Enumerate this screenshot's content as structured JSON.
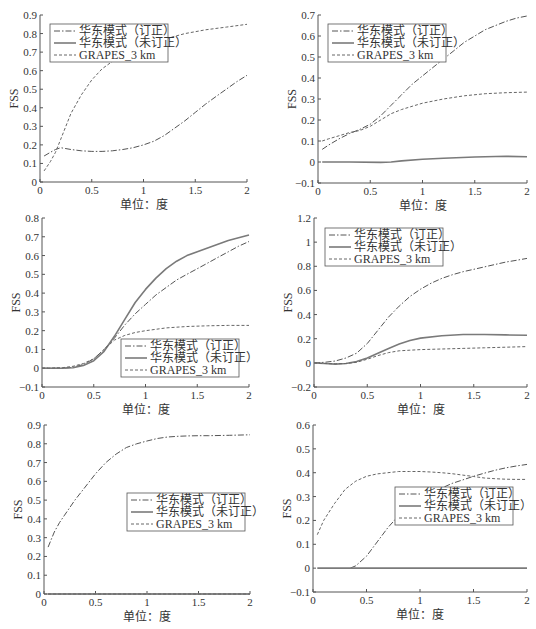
{
  "figure": {
    "width": 536,
    "height": 629,
    "colors": {
      "axis": "#555555",
      "corrected": "#555555",
      "uncorrected": "#7a7a7a",
      "grapes": "#666666",
      "text": "#333333"
    }
  },
  "legend_labels": {
    "corrected": "华东模式（订正）",
    "uncorrected": "华东模式（未订正）",
    "grapes": "GRAPES_3 km"
  },
  "chart_data": [
    {
      "id": "panel-1",
      "type": "line",
      "title": "",
      "xlabel": "单位：度",
      "ylabel": "FSS",
      "xlim": [
        0,
        2
      ],
      "ylim": [
        0,
        0.9
      ],
      "xticks": [
        0,
        0.5,
        1,
        1.5,
        2
      ],
      "xtick_labels": [
        "0",
        "0.5",
        "1",
        "1.5",
        "2"
      ],
      "yticks": [
        0,
        0.1,
        0.2,
        0.3,
        0.4,
        0.5,
        0.6,
        0.7,
        0.8,
        0.9
      ],
      "ytick_labels": [
        "0",
        "0.1",
        "0.2",
        "0.3",
        "0.4",
        "0.5",
        "0.6",
        "0.7",
        "0.8",
        "0.9"
      ],
      "grid": false,
      "legend_position": "upper left",
      "box": {
        "left": 40,
        "top": 15,
        "right": 247,
        "bottom": 182
      },
      "legend_box": {
        "x": 50,
        "y": 24,
        "w": 118,
        "h": 38
      },
      "series": [
        {
          "name": "华东模式（订正）",
          "style": "dashdot",
          "x": [
            0.04,
            0.1,
            0.15,
            0.2,
            0.25,
            0.3,
            0.4,
            0.5,
            0.6,
            0.7,
            0.8,
            0.9,
            1.0,
            1.1,
            1.2,
            1.3,
            1.4,
            1.5,
            1.6,
            1.7,
            1.8,
            1.9,
            2.0
          ],
          "values": [
            0.14,
            0.16,
            0.175,
            0.185,
            0.18,
            0.175,
            0.168,
            0.165,
            0.165,
            0.168,
            0.175,
            0.185,
            0.2,
            0.22,
            0.25,
            0.29,
            0.33,
            0.375,
            0.42,
            0.46,
            0.5,
            0.54,
            0.575
          ]
        },
        {
          "name": "华东模式（未订正）",
          "style": "solid",
          "x": [],
          "values": []
        },
        {
          "name": "GRAPES_3 km",
          "style": "dashed",
          "x": [
            0.04,
            0.1,
            0.15,
            0.2,
            0.3,
            0.4,
            0.5,
            0.6,
            0.7,
            0.8,
            0.9,
            1.0,
            1.2,
            1.4,
            1.6,
            1.8,
            2.0
          ],
          "values": [
            0.06,
            0.11,
            0.16,
            0.23,
            0.37,
            0.47,
            0.55,
            0.61,
            0.65,
            0.68,
            0.71,
            0.73,
            0.77,
            0.8,
            0.82,
            0.835,
            0.85
          ]
        }
      ]
    },
    {
      "id": "panel-2",
      "type": "line",
      "title": "",
      "xlabel": "单位：度",
      "ylabel": "FSS",
      "xlim": [
        0,
        2
      ],
      "ylim": [
        -0.1,
        0.7
      ],
      "xticks": [
        0,
        0.5,
        1,
        1.5,
        2
      ],
      "xtick_labels": [
        "0",
        "0.5",
        "1",
        "1.5",
        "2"
      ],
      "yticks": [
        -0.1,
        0,
        0.1,
        0.2,
        0.3,
        0.4,
        0.5,
        0.6,
        0.7
      ],
      "ytick_labels": [
        "−0.1",
        "0",
        "0.1",
        "0.2",
        "0.3",
        "0.4",
        "0.5",
        "0.6",
        "0.7"
      ],
      "grid": false,
      "legend_position": "upper left",
      "box": {
        "left": 318,
        "top": 15,
        "right": 527,
        "bottom": 183
      },
      "legend_box": {
        "x": 328,
        "y": 24,
        "w": 118,
        "h": 38
      },
      "series": [
        {
          "name": "华东模式（订正）",
          "style": "dashdot",
          "x": [
            0.04,
            0.1,
            0.2,
            0.3,
            0.4,
            0.5,
            0.6,
            0.7,
            0.8,
            0.9,
            1.0,
            1.1,
            1.2,
            1.3,
            1.4,
            1.5,
            1.6,
            1.7,
            1.8,
            1.9,
            2.0
          ],
          "values": [
            0.06,
            0.08,
            0.11,
            0.135,
            0.155,
            0.18,
            0.22,
            0.27,
            0.32,
            0.37,
            0.41,
            0.45,
            0.49,
            0.53,
            0.57,
            0.6,
            0.63,
            0.65,
            0.67,
            0.685,
            0.695
          ]
        },
        {
          "name": "华东模式（未订正）",
          "style": "solid",
          "x": [
            0.04,
            0.3,
            0.6,
            0.7,
            0.8,
            1.0,
            1.2,
            1.5,
            1.8,
            2.0
          ],
          "values": [
            0.0,
            0.0,
            -0.002,
            0.0,
            0.005,
            0.013,
            0.018,
            0.024,
            0.027,
            0.025
          ]
        },
        {
          "name": "GRAPES_3 km",
          "style": "dashed",
          "x": [
            0.04,
            0.1,
            0.2,
            0.3,
            0.4,
            0.5,
            0.6,
            0.7,
            0.8,
            0.9,
            1.0,
            1.2,
            1.4,
            1.6,
            1.8,
            2.0
          ],
          "values": [
            0.1,
            0.11,
            0.125,
            0.14,
            0.15,
            0.17,
            0.2,
            0.23,
            0.25,
            0.265,
            0.28,
            0.3,
            0.315,
            0.325,
            0.33,
            0.333
          ]
        }
      ]
    },
    {
      "id": "panel-3",
      "type": "line",
      "title": "",
      "xlabel": "单位：度",
      "ylabel": "FSS",
      "xlim": [
        0,
        2
      ],
      "ylim": [
        -0.1,
        0.8
      ],
      "xticks": [
        0,
        0.5,
        1,
        1.5,
        2
      ],
      "xtick_labels": [
        "0",
        "0.5",
        "1",
        "1.5",
        "2"
      ],
      "yticks": [
        -0.1,
        0,
        0.1,
        0.2,
        0.3,
        0.4,
        0.5,
        0.6,
        0.7,
        0.8
      ],
      "ytick_labels": [
        "−0.1",
        "0",
        "0.1",
        "0.2",
        "0.3",
        "0.4",
        "0.5",
        "0.6",
        "0.7",
        "0.8"
      ],
      "grid": false,
      "legend_position": "lower right",
      "box": {
        "left": 42,
        "top": 218,
        "right": 249,
        "bottom": 387
      },
      "legend_box": {
        "x": 121,
        "y": 339,
        "w": 118,
        "h": 38
      },
      "series": [
        {
          "name": "华东模式（订正）",
          "style": "dashdot",
          "x": [
            0,
            0.2,
            0.3,
            0.4,
            0.5,
            0.6,
            0.7,
            0.8,
            0.9,
            1.0,
            1.1,
            1.2,
            1.3,
            1.4,
            1.5,
            1.6,
            1.7,
            1.8,
            1.9,
            2.0
          ],
          "values": [
            0,
            0,
            0.005,
            0.02,
            0.05,
            0.1,
            0.16,
            0.23,
            0.29,
            0.34,
            0.39,
            0.43,
            0.47,
            0.5,
            0.53,
            0.56,
            0.59,
            0.62,
            0.65,
            0.675
          ]
        },
        {
          "name": "华东模式（未订正）",
          "style": "solid",
          "x": [
            0,
            0.2,
            0.3,
            0.4,
            0.5,
            0.6,
            0.7,
            0.8,
            0.9,
            1.0,
            1.1,
            1.2,
            1.3,
            1.4,
            1.5,
            1.6,
            1.7,
            1.8,
            1.9,
            2.0
          ],
          "values": [
            0,
            0,
            0.003,
            0.015,
            0.04,
            0.09,
            0.17,
            0.26,
            0.35,
            0.42,
            0.48,
            0.53,
            0.57,
            0.6,
            0.62,
            0.64,
            0.66,
            0.68,
            0.695,
            0.71
          ]
        },
        {
          "name": "GRAPES_3 km",
          "style": "dashed",
          "x": [
            0,
            0.2,
            0.3,
            0.4,
            0.5,
            0.6,
            0.7,
            0.8,
            0.9,
            1.0,
            1.2,
            1.4,
            1.6,
            1.8,
            2.0
          ],
          "values": [
            0,
            0.003,
            0.01,
            0.025,
            0.05,
            0.1,
            0.15,
            0.175,
            0.19,
            0.2,
            0.215,
            0.222,
            0.226,
            0.228,
            0.228
          ]
        }
      ]
    },
    {
      "id": "panel-4",
      "type": "line",
      "title": "",
      "xlabel": "单位：度",
      "ylabel": "FSS",
      "xlim": [
        0,
        2
      ],
      "ylim": [
        -0.2,
        1.2
      ],
      "xticks": [
        0,
        0.5,
        1,
        1.5,
        2
      ],
      "xtick_labels": [
        "0",
        "0.5",
        "1",
        "1.5",
        "2"
      ],
      "yticks": [
        -0.2,
        0,
        0.2,
        0.4,
        0.6,
        0.8,
        1.0,
        1.2
      ],
      "ytick_labels": [
        "−0.2",
        "0",
        "0.2",
        "0.4",
        "0.6",
        "0.8",
        "1",
        "1.2"
      ],
      "grid": false,
      "legend_position": "upper left",
      "box": {
        "left": 314,
        "top": 218,
        "right": 527,
        "bottom": 387
      },
      "legend_box": {
        "x": 325,
        "y": 228,
        "w": 118,
        "h": 38
      },
      "series": [
        {
          "name": "华东模式（订正）",
          "style": "dashdot",
          "x": [
            0,
            0.1,
            0.2,
            0.3,
            0.4,
            0.5,
            0.6,
            0.7,
            0.8,
            0.9,
            1.0,
            1.1,
            1.2,
            1.3,
            1.4,
            1.5,
            1.6,
            1.7,
            1.8,
            1.9,
            2.0
          ],
          "values": [
            0,
            0.005,
            0.015,
            0.04,
            0.08,
            0.16,
            0.27,
            0.38,
            0.47,
            0.55,
            0.61,
            0.66,
            0.7,
            0.73,
            0.755,
            0.775,
            0.795,
            0.815,
            0.835,
            0.85,
            0.865
          ]
        },
        {
          "name": "华东模式（未订正）",
          "style": "solid",
          "x": [
            0,
            0.1,
            0.2,
            0.3,
            0.4,
            0.5,
            0.6,
            0.7,
            0.8,
            0.9,
            1.0,
            1.2,
            1.4,
            1.6,
            1.8,
            2.0
          ],
          "values": [
            0,
            -0.005,
            -0.01,
            -0.005,
            0.01,
            0.04,
            0.08,
            0.12,
            0.155,
            0.185,
            0.205,
            0.225,
            0.235,
            0.235,
            0.232,
            0.228
          ]
        },
        {
          "name": "GRAPES_3 km",
          "style": "dashed",
          "x": [
            0,
            0.1,
            0.2,
            0.3,
            0.4,
            0.5,
            0.6,
            0.7,
            0.8,
            0.9,
            1.0,
            1.2,
            1.4,
            1.6,
            1.8,
            2.0
          ],
          "values": [
            0,
            -0.005,
            -0.008,
            -0.005,
            0.005,
            0.03,
            0.06,
            0.085,
            0.1,
            0.105,
            0.11,
            0.115,
            0.12,
            0.125,
            0.13,
            0.135
          ]
        }
      ]
    },
    {
      "id": "panel-5",
      "type": "line",
      "title": "",
      "xlabel": "单位：度",
      "ylabel": "FSS",
      "xlim": [
        0,
        2
      ],
      "ylim": [
        0,
        0.9
      ],
      "xticks": [
        0,
        0.5,
        1,
        1.5,
        2
      ],
      "xtick_labels": [
        "0",
        "0.5",
        "1",
        "1.5",
        "2"
      ],
      "yticks": [
        0,
        0.1,
        0.2,
        0.3,
        0.4,
        0.5,
        0.6,
        0.7,
        0.8,
        0.9
      ],
      "ytick_labels": [
        "0",
        "0.1",
        "0.2",
        "0.3",
        "0.4",
        "0.5",
        "0.6",
        "0.7",
        "0.8",
        "0.9"
      ],
      "grid": false,
      "legend_position": "center right",
      "box": {
        "left": 44,
        "top": 425,
        "right": 250,
        "bottom": 594
      },
      "legend_box": {
        "x": 127,
        "y": 493,
        "w": 118,
        "h": 38
      },
      "series": [
        {
          "name": "华东模式（订正）",
          "style": "dashdot",
          "x": [
            0.04,
            0.1,
            0.15,
            0.2,
            0.3,
            0.4,
            0.5,
            0.6,
            0.7,
            0.8,
            0.9,
            1.0,
            1.1,
            1.2,
            1.3,
            1.4,
            1.5,
            1.6,
            1.8,
            2.0
          ],
          "values": [
            0.25,
            0.33,
            0.38,
            0.42,
            0.5,
            0.57,
            0.64,
            0.7,
            0.745,
            0.78,
            0.8,
            0.815,
            0.828,
            0.836,
            0.84,
            0.842,
            0.843,
            0.843,
            0.845,
            0.848
          ]
        },
        {
          "name": "华东模式（未订正）",
          "style": "solid",
          "x": [
            0.04,
            2.0
          ],
          "values": [
            0.0,
            0.0
          ]
        },
        {
          "name": "GRAPES_3 km",
          "style": "dashed",
          "x": [
            0.04,
            2.0
          ],
          "values": [
            0.0,
            0.0
          ]
        }
      ]
    },
    {
      "id": "panel-6",
      "type": "line",
      "title": "",
      "xlabel": "单位：度",
      "ylabel": "FSS",
      "xlim": [
        0,
        2
      ],
      "ylim": [
        -0.1,
        0.6
      ],
      "xticks": [
        0,
        0.5,
        1,
        1.5,
        2
      ],
      "xtick_labels": [
        "0",
        "0.5",
        "1",
        "1.5",
        "2"
      ],
      "yticks": [
        -0.1,
        0,
        0.1,
        0.2,
        0.3,
        0.4,
        0.5,
        0.6
      ],
      "ytick_labels": [
        "−0.1",
        "0",
        "0.1",
        "0.2",
        "0.3",
        "0.4",
        "0.5",
        "0.6"
      ],
      "grid": false,
      "legend_position": "center right",
      "box": {
        "left": 313,
        "top": 425,
        "right": 527,
        "bottom": 592
      },
      "legend_box": {
        "x": 395,
        "y": 487,
        "w": 118,
        "h": 38
      },
      "series": [
        {
          "name": "华东模式（订正）",
          "style": "dashdot",
          "x": [
            0.35,
            0.4,
            0.5,
            0.6,
            0.7,
            0.8,
            0.9,
            1.0,
            1.1,
            1.2,
            1.3,
            1.4,
            1.5,
            1.6,
            1.7,
            1.8,
            1.9,
            2.0
          ],
          "values": [
            0.0,
            0.01,
            0.05,
            0.11,
            0.17,
            0.22,
            0.26,
            0.29,
            0.315,
            0.335,
            0.355,
            0.37,
            0.385,
            0.398,
            0.41,
            0.42,
            0.428,
            0.435
          ]
        },
        {
          "name": "华东模式（未订正）",
          "style": "solid",
          "x": [
            0.04,
            2.0
          ],
          "values": [
            0.0,
            0.0
          ]
        },
        {
          "name": "GRAPES_3 km",
          "style": "dashed",
          "x": [
            0.04,
            0.1,
            0.2,
            0.3,
            0.4,
            0.5,
            0.6,
            0.7,
            0.8,
            0.9,
            1.0,
            1.1,
            1.2,
            1.3,
            1.4,
            1.5,
            1.6,
            1.7,
            1.8,
            1.9,
            2.0
          ],
          "values": [
            0.14,
            0.2,
            0.27,
            0.33,
            0.365,
            0.385,
            0.395,
            0.4,
            0.405,
            0.405,
            0.405,
            0.403,
            0.4,
            0.396,
            0.39,
            0.384,
            0.378,
            0.375,
            0.373,
            0.372,
            0.372
          ]
        }
      ]
    }
  ]
}
